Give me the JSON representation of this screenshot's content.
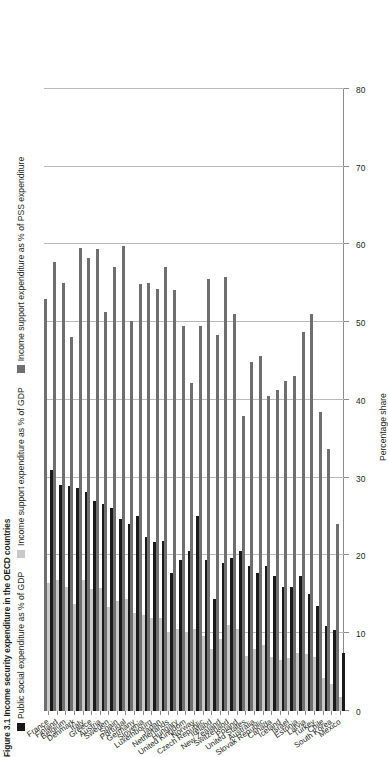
{
  "figure": {
    "title": "Figure 3.1 Income security expenditure in the OECD countries"
  },
  "legend": {
    "position": "top",
    "items": [
      {
        "label": "Public social expenditure as % of GDP",
        "color": "#1a1a1a",
        "key": "public_social_gdp"
      },
      {
        "label": "Income support expenditure as % of GDP",
        "color": "#c9c9c9",
        "key": "income_support_gdp"
      },
      {
        "label": "Income support expenditure as % of PSS expenditure",
        "color": "#6f6f6f",
        "key": "income_support_pss"
      }
    ]
  },
  "axes": {
    "value_axis_title": "Percentage share",
    "value_ticks": [
      0,
      10,
      20,
      30,
      40,
      50,
      60,
      70,
      80
    ],
    "value_min": 0,
    "value_max": 80,
    "value_axis_reversed": true,
    "category_axis_title": ""
  },
  "chart_data": {
    "type": "bar",
    "orientation": "horizontal",
    "title": "Figure 3.1 Income security expenditure in the OECD countries",
    "xlabel": "Percentage share",
    "ylabel": "",
    "xlim": [
      0,
      80
    ],
    "grid": true,
    "legend_position": "top",
    "categories": [
      "France",
      "Finland",
      "Belgium",
      "Denmark",
      "Italy",
      "Greece",
      "Austria",
      "Sweden",
      "Spain",
      "Portugal",
      "Germany",
      "Slovenia",
      "Luxembourg",
      "Japan",
      "Netherlands",
      "Hungary",
      "United Kingdom",
      "Norway",
      "Czech Republic",
      "Ireland",
      "New Zealand",
      "Switzerland",
      "Poland",
      "United States",
      "Australia",
      "Slovak Republic",
      "Canada",
      "Iceland",
      "Israel",
      "Estonia",
      "Latvia",
      "Turkey",
      "Chile",
      "South Korea",
      "Mexico"
    ],
    "series": [
      {
        "name": "Public social expenditure as % of GDP",
        "color": "#1a1a1a",
        "values": [
          31.0,
          29.1,
          28.9,
          28.7,
          28.2,
          27.0,
          26.6,
          26.1,
          24.7,
          24.1,
          25.1,
          22.4,
          21.8,
          21.9,
          17.7,
          19.4,
          20.6,
          25.1,
          19.4,
          14.4,
          19.0,
          19.7,
          20.6,
          18.7,
          17.8,
          18.6,
          17.3,
          16.0,
          16.0,
          17.4,
          15.0,
          13.5,
          10.9,
          10.4,
          7.5
        ]
      },
      {
        "name": "Income support expenditure as % of GDP",
        "color": "#c9c9c9",
        "values": [
          16.4,
          16.8,
          15.9,
          13.8,
          16.8,
          15.7,
          15.8,
          13.4,
          14.1,
          14.4,
          12.6,
          12.3,
          12.0,
          11.9,
          10.1,
          10.5,
          10.2,
          10.6,
          9.6,
          8.0,
          9.2,
          11.0,
          10.5,
          7.1,
          8.0,
          8.5,
          7.0,
          6.6,
          6.8,
          7.5,
          7.3,
          6.9,
          4.2,
          3.5,
          1.8
        ]
      },
      {
        "name": "Income support expenditure as % of PSS expenditure",
        "color": "#6f6f6f",
        "values": [
          53.0,
          57.8,
          55.0,
          48.1,
          59.6,
          58.2,
          59.4,
          51.3,
          57.1,
          59.8,
          50.2,
          54.9,
          55.0,
          54.3,
          57.1,
          54.1,
          49.5,
          42.2,
          49.5,
          55.6,
          48.4,
          55.8,
          51.0,
          38.0,
          44.9,
          45.7,
          40.5,
          41.3,
          42.5,
          43.1,
          48.7,
          51.1,
          38.5,
          33.7,
          24.0
        ]
      }
    ]
  }
}
